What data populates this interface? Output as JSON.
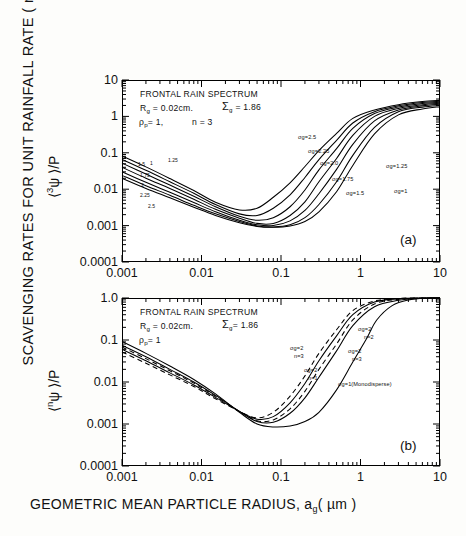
{
  "figure": {
    "y_axis_title": "SCAVENGING RATES FOR UNIT RAINFALL RATE ( mm",
    "y_axis_title_sup": "-1",
    "y_axis_title_tail": ")",
    "x_axis_title": "GEOMETRIC MEAN PARTICLE RADIUS, a",
    "x_axis_title_sub": "g",
    "x_axis_title_tail": "( µm )"
  },
  "chart_data": [
    {
      "type": "line",
      "panel": "(a)",
      "title": "FRONTAL RAIN SPECTRUM",
      "xlabel": "GEOMETRIC MEAN PARTICLE RADIUS, a_g (µm)",
      "ylabel": "<3ψ>/P",
      "xlim": [
        0.001,
        10
      ],
      "ylim": [
        0.0001,
        10
      ],
      "xscale": "log",
      "yscale": "log",
      "grid": false,
      "xticks": [
        "0.001",
        "0.01",
        "0.1",
        "1",
        "10"
      ],
      "yticks": [
        "0.0001",
        "0.001",
        "0.01",
        "0.1",
        "1",
        "10"
      ],
      "annotations": [
        "FRONTAL RAIN SPECTRUM",
        "R_g = 0.02cm.",
        "Σ_g = 1.86",
        "ρ_p = 1,",
        "n = 3"
      ],
      "legend_position": "inline-on-curves",
      "series": [
        {
          "name": "σg=1",
          "right_label": "σg=1",
          "left_label": "1",
          "x": [
            0.001,
            0.002,
            0.004,
            0.008,
            0.015,
            0.03,
            0.05,
            0.08,
            0.13,
            0.2,
            0.3,
            0.5,
            0.8,
            1.5,
            3,
            6,
            10
          ],
          "values": [
            0.02,
            0.0105,
            0.0058,
            0.0032,
            0.0019,
            0.0012,
            0.00095,
            0.0009,
            0.00098,
            0.0013,
            0.0024,
            0.0085,
            0.045,
            0.33,
            1.1,
            1.6,
            1.85
          ]
        },
        {
          "name": "σg=1.25",
          "right_label": "σg=1.25",
          "left_label": "1.25",
          "x": [
            0.001,
            0.002,
            0.004,
            0.008,
            0.015,
            0.03,
            0.05,
            0.08,
            0.13,
            0.2,
            0.3,
            0.5,
            0.8,
            1.5,
            3,
            6,
            10
          ],
          "values": [
            0.024,
            0.0125,
            0.0068,
            0.0036,
            0.0021,
            0.0013,
            0.00098,
            0.00092,
            0.00105,
            0.00165,
            0.0038,
            0.016,
            0.085,
            0.5,
            1.35,
            1.8,
            2.0
          ]
        },
        {
          "name": "σg=1.5",
          "right_label": "σg=1.5",
          "left_label": "1.5",
          "x": [
            0.001,
            0.002,
            0.004,
            0.008,
            0.015,
            0.03,
            0.05,
            0.08,
            0.13,
            0.2,
            0.3,
            0.5,
            0.8,
            1.5,
            3,
            6,
            10
          ],
          "values": [
            0.03,
            0.0155,
            0.0082,
            0.0043,
            0.0024,
            0.0014,
            0.00105,
            0.001,
            0.00135,
            0.0026,
            0.0075,
            0.035,
            0.17,
            0.75,
            1.5,
            1.95,
            2.15
          ]
        },
        {
          "name": "σg=1.75",
          "right_label": "σg=1.75",
          "left_label": "1.75",
          "x": [
            0.001,
            0.002,
            0.004,
            0.008,
            0.015,
            0.03,
            0.05,
            0.08,
            0.13,
            0.2,
            0.3,
            0.5,
            0.8,
            1.5,
            3,
            6,
            10
          ],
          "values": [
            0.04,
            0.02,
            0.0105,
            0.0053,
            0.0028,
            0.0016,
            0.00115,
            0.00115,
            0.0019,
            0.0045,
            0.016,
            0.07,
            0.3,
            1.0,
            1.65,
            2.1,
            2.3
          ]
        },
        {
          "name": "σg=2.0",
          "right_label": "σg=2.0",
          "left_label": "2",
          "x": [
            0.001,
            0.002,
            0.004,
            0.008,
            0.015,
            0.03,
            0.05,
            0.08,
            0.13,
            0.2,
            0.3,
            0.5,
            0.8,
            1.5,
            3,
            6,
            10
          ],
          "values": [
            0.052,
            0.026,
            0.013,
            0.0064,
            0.0033,
            0.0018,
            0.0014,
            0.00165,
            0.0033,
            0.0095,
            0.034,
            0.13,
            0.47,
            1.2,
            1.8,
            2.25,
            2.45
          ]
        },
        {
          "name": "σg=2.25",
          "right_label": "σg=2.25",
          "left_label": "2.25",
          "x": [
            0.001,
            0.002,
            0.004,
            0.008,
            0.015,
            0.03,
            0.05,
            0.08,
            0.13,
            0.2,
            0.3,
            0.5,
            0.8,
            1.5,
            3,
            6,
            10
          ],
          "values": [
            0.066,
            0.033,
            0.016,
            0.0077,
            0.0038,
            0.0021,
            0.0019,
            0.003,
            0.007,
            0.021,
            0.065,
            0.22,
            0.66,
            1.35,
            1.95,
            2.4,
            2.6
          ]
        },
        {
          "name": "σg=2.5",
          "right_label": "σg=2.5",
          "left_label": "2.5",
          "x": [
            0.001,
            0.002,
            0.004,
            0.008,
            0.015,
            0.03,
            0.05,
            0.08,
            0.13,
            0.2,
            0.3,
            0.5,
            0.8,
            1.5,
            3,
            6,
            10
          ],
          "values": [
            0.082,
            0.041,
            0.0196,
            0.0092,
            0.0044,
            0.0027,
            0.003,
            0.006,
            0.015,
            0.042,
            0.115,
            0.34,
            0.88,
            1.5,
            2.1,
            2.55,
            2.75
          ]
        }
      ]
    },
    {
      "type": "line",
      "panel": "(b)",
      "title": "FRONTAL RAIN SPECTRUM",
      "xlabel": "GEOMETRIC MEAN PARTICLE RADIUS, a_g (µm)",
      "ylabel": "<nψ>/P",
      "xlim": [
        0.001,
        10
      ],
      "ylim": [
        0.0001,
        1.0
      ],
      "xscale": "log",
      "yscale": "log",
      "grid": false,
      "xticks": [
        "0.001",
        "0.01",
        "0.1",
        "1",
        "10"
      ],
      "yticks": [
        "0.0001",
        "0.001",
        "0.01",
        "0.1",
        "1.0"
      ],
      "annotations": [
        "FRONTAL RAIN SPECTRUM",
        "R_g = 0.02cm.",
        "Σ_g = 1.86",
        "ρ_p = 1"
      ],
      "legend_position": "inline-on-curves",
      "series": [
        {
          "name": "σg=2 n=1",
          "label_line1": "σg=2",
          "label_line2": "n=1",
          "style": "solid",
          "x": [
            0.001,
            0.002,
            0.004,
            0.008,
            0.015,
            0.03,
            0.05,
            0.08,
            0.13,
            0.2,
            0.3,
            0.5,
            0.8,
            1.5,
            3,
            6,
            10
          ],
          "values": [
            0.075,
            0.04,
            0.02,
            0.01,
            0.0048,
            0.002,
            0.00115,
            0.0011,
            0.0018,
            0.0042,
            0.013,
            0.055,
            0.22,
            0.62,
            0.88,
            0.98,
            1.02
          ]
        },
        {
          "name": "σg=2 n=2",
          "label_line1": "σg=2",
          "label_line2": "n=2",
          "style": "dashed",
          "x": [
            0.001,
            0.002,
            0.004,
            0.008,
            0.015,
            0.03,
            0.05,
            0.08,
            0.13,
            0.2,
            0.3,
            0.5,
            0.8,
            1.5,
            3,
            6,
            10
          ],
          "values": [
            0.068,
            0.036,
            0.0185,
            0.0094,
            0.0046,
            0.002,
            0.0012,
            0.00125,
            0.0023,
            0.006,
            0.02,
            0.08,
            0.3,
            0.72,
            0.93,
            1.0,
            1.04
          ]
        },
        {
          "name": "σg=2 n=3",
          "label_line1": "σg=2",
          "label_line2": "n=3",
          "style": "solid",
          "x": [
            0.001,
            0.002,
            0.004,
            0.008,
            0.015,
            0.03,
            0.05,
            0.08,
            0.13,
            0.2,
            0.3,
            0.5,
            0.8,
            1.5,
            3,
            6,
            10
          ],
          "values": [
            0.06,
            0.032,
            0.0165,
            0.0085,
            0.0043,
            0.002,
            0.0013,
            0.0015,
            0.0032,
            0.0092,
            0.032,
            0.125,
            0.4,
            0.8,
            0.96,
            1.02,
            1.06
          ]
        },
        {
          "name": "σg=2 n=3 dashed",
          "label_line1": "σg=2",
          "label_line2": "n=3",
          "style": "dashed",
          "x": [
            0.001,
            0.002,
            0.004,
            0.008,
            0.015,
            0.03,
            0.05,
            0.08,
            0.13,
            0.2,
            0.3,
            0.5,
            0.8,
            1.5,
            3,
            6,
            10
          ],
          "values": [
            0.052,
            0.028,
            0.0148,
            0.0078,
            0.004,
            0.002,
            0.0014,
            0.0019,
            0.0046,
            0.014,
            0.048,
            0.175,
            0.5,
            0.85,
            0.98,
            1.04,
            1.08
          ]
        },
        {
          "name": "σg=1 (Monodisperse)",
          "label_line1": "σg=1(Monodisperse)",
          "style": "solid",
          "x": [
            0.001,
            0.002,
            0.004,
            0.008,
            0.015,
            0.03,
            0.05,
            0.08,
            0.13,
            0.2,
            0.3,
            0.5,
            0.8,
            1.2,
            1.6,
            2.5,
            4,
            7,
            10
          ],
          "values": [
            0.092,
            0.048,
            0.024,
            0.0115,
            0.0052,
            0.0019,
            0.001,
            0.00085,
            0.0009,
            0.00115,
            0.0019,
            0.0065,
            0.03,
            0.11,
            0.3,
            0.66,
            0.9,
            1.0,
            1.04
          ]
        }
      ]
    }
  ],
  "panelA": {
    "id": "(a)",
    "ytitle_pre": "⟨",
    "ytitle_sup": "3",
    "ytitle_post": "ψ ⟩/P",
    "yticks": [
      "10",
      "1",
      "0.1",
      "0.01",
      "0.001",
      "0.0001"
    ],
    "xticks": [
      "0.001",
      "0.01",
      "0.1",
      "1",
      "10"
    ],
    "annot_line1": "FRONTAL RAIN SPECTRUM",
    "annot_rg": "R",
    "annot_rg_sub": "g",
    "annot_rg_val": "= 0.02cm.",
    "annot_sigma": "Σ",
    "annot_sigma_sub": "g",
    "annot_sigma_val": "= 1.86",
    "annot_rho": "ρ",
    "annot_rho_sub": "p",
    "annot_rho_val": "= 1,",
    "annot_n": "n = 3",
    "right_labels": [
      "σg=2.5",
      "σg=2.25",
      "σg=2.0",
      "σg=1.75",
      "σg=1.5",
      "σg=1.25",
      "σg=1"
    ],
    "left_labels": [
      "1",
      "1.25",
      "1.5",
      "1.75",
      "2",
      "2.25",
      "2.5"
    ]
  },
  "panelB": {
    "id": "(b)",
    "ytitle_pre": "⟨",
    "ytitle_sup": "n",
    "ytitle_post": "ψ ⟩/P",
    "yticks": [
      "1.0",
      "0.1",
      "0.01",
      "0.001",
      "0.0001"
    ],
    "xticks": [
      "0.001",
      "0.01",
      "0.1",
      "1",
      "10"
    ],
    "annot_line1": "FRONTAL RAIN SPECTRUM",
    "annot_rg": "R",
    "annot_rg_sub": "g",
    "annot_rg_val": "= 0.02cm.",
    "annot_sigma": "Σ",
    "annot_sigma_sub": "g",
    "annot_sigma_val": "= 1.86",
    "annot_rho": "ρ",
    "annot_rho_sub": "p",
    "annot_rho_val": "= 1",
    "lab_top_s": "σg=2",
    "lab_top_n": "n=2",
    "lab_mid_s": "σg=2",
    "lab_mid_n": "n=3",
    "lab_left_s": "σg=2",
    "lab_left_n": "n=3",
    "lab_low_s": "σg=2",
    "lab_low_n": "n=1",
    "lab_mono": "σg=1(Monodisperse)"
  }
}
